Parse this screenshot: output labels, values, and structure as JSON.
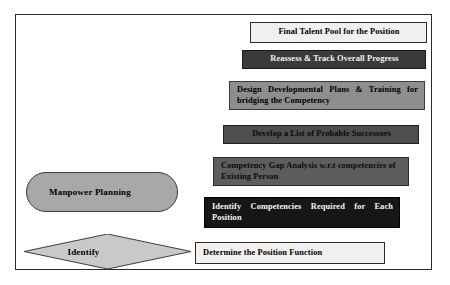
{
  "diagram": {
    "frame": {
      "border_color": "#2b2b2b",
      "background": "#ffffff"
    },
    "left_shapes": [
      {
        "name": "manpower-planning",
        "label": "Manpower Planning",
        "shape": "stadium",
        "fill": "#a8a8a8",
        "border": "#3c3c3c",
        "text_color": "#000000",
        "x": 26,
        "y": 172,
        "width": 152,
        "height": 40
      },
      {
        "name": "identify",
        "label": "Identify",
        "shape": "diamond",
        "fill": "#c9c9c9",
        "border": "#3c3c3c",
        "text_color": "#000000",
        "x": 24,
        "y": 234,
        "width": 167,
        "height": 35
      }
    ],
    "steps": [
      {
        "name": "final-talent-pool",
        "label": "Final Talent Pool for the Position",
        "fill": "#f2f0ee",
        "border": "#2b2b2b",
        "text_color": "#000000",
        "align": "center",
        "x": 250,
        "y": 22,
        "width": 177,
        "height": 21
      },
      {
        "name": "reassess-track-progress",
        "label": "Reassess & Track Overall Progress",
        "fill": "#3a3a3a",
        "border": "#1a1a1a",
        "text_color": "#f2f2f2",
        "align": "center",
        "x": 242,
        "y": 50,
        "width": 184,
        "height": 19
      },
      {
        "name": "design-developmental-plans",
        "label": "Design Developmental Plans & Training for bridging the Competency",
        "fill": "#8e8e8e",
        "border": "#3c3c3c",
        "text_color": "#000000",
        "align": "justify",
        "x": 229,
        "y": 81,
        "width": 196,
        "height": 29
      },
      {
        "name": "develop-list-successors",
        "label": "Develop a List of Probable Successors",
        "fill": "#4e4e4e",
        "border": "#1f1f1f",
        "text_color": "#0a0a0a",
        "align": "center",
        "x": 223,
        "y": 125,
        "width": 196,
        "height": 19
      },
      {
        "name": "competency-gap-analysis",
        "label": "Competency Gap Analysis w.r.t competencies of Existing Person",
        "fill": "#5d5d5d",
        "border": "#2a2a2a",
        "text_color": "#0a0a0a",
        "align": "left",
        "x": 213,
        "y": 157,
        "width": 196,
        "height": 29
      },
      {
        "name": "identify-competencies-required",
        "label": "Identify Competencies Required for Each Position",
        "fill": "#161616",
        "border": "#000000",
        "text_color": "#f5f5f5",
        "align": "justify",
        "x": 204,
        "y": 197,
        "width": 196,
        "height": 31
      },
      {
        "name": "determine-position-function",
        "label": "Determine the Position Function",
        "fill": "#f2f0ee",
        "border": "#2b2b2b",
        "text_color": "#000000",
        "align": "left",
        "x": 195,
        "y": 242,
        "width": 190,
        "height": 22
      }
    ]
  }
}
